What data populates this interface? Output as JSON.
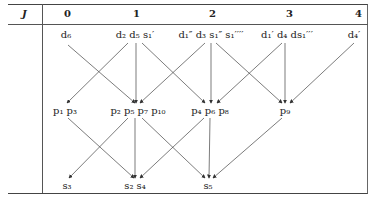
{
  "header": {
    "j_label": "J",
    "columns": [
      "0",
      "1",
      "2",
      "3",
      "4"
    ]
  },
  "rows": {
    "d": [
      {
        "id": "d-0",
        "label": "d₆"
      },
      {
        "id": "d-1",
        "label": "d₂ d₅ s₁′"
      },
      {
        "id": "d-2",
        "label": "d₁″ d₃ s₁″ s₁′′′′"
      },
      {
        "id": "d-3",
        "label": "d₁′ d₄ ds₁′′′"
      },
      {
        "id": "d-4",
        "label": "d₄′"
      }
    ],
    "p": [
      {
        "id": "p-0",
        "label": "p₁ p₃"
      },
      {
        "id": "p-1",
        "label": "p₂ p₅ p₇ p₁₀"
      },
      {
        "id": "p-2",
        "label": "p₄ p₆ p₈"
      },
      {
        "id": "p-3",
        "label": "p₉"
      }
    ],
    "s": [
      {
        "id": "s-0",
        "label": "s₃"
      },
      {
        "id": "s-1",
        "label": "s₂ s₄"
      },
      {
        "id": "s-2",
        "label": "s₅"
      }
    ]
  }
}
